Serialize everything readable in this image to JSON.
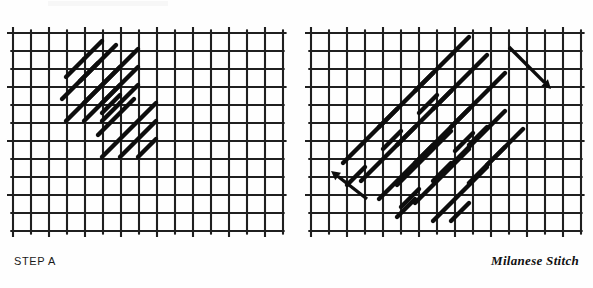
{
  "figure": {
    "title": "Milanese Stitch",
    "panels": [
      {
        "id": "a",
        "caption": "STEP A",
        "grid": {
          "x": 13,
          "y": 33,
          "cols": 15,
          "rows": 11,
          "cell": 18,
          "overhang": 6,
          "line_color": "#1f1f1f",
          "line_width": 2.1
        },
        "stitch_color": "#0d0d0d",
        "stitch_width": 4.4,
        "stitches": [
          {
            "x1": 66,
            "y1": 77,
            "x2": 84,
            "y2": 59
          },
          {
            "x1": 62,
            "y1": 99,
            "x2": 98,
            "y2": 63
          },
          {
            "x1": 66,
            "y1": 121,
            "x2": 120,
            "y2": 67
          },
          {
            "x1": 84,
            "y1": 121,
            "x2": 120,
            "y2": 85
          },
          {
            "x1": 102,
            "y1": 121,
            "x2": 120,
            "y2": 103
          },
          {
            "x1": 102,
            "y1": 113,
            "x2": 120,
            "y2": 95
          },
          {
            "x1": 98,
            "y1": 135,
            "x2": 134,
            "y2": 99
          },
          {
            "x1": 102,
            "y1": 157,
            "x2": 156,
            "y2": 103
          },
          {
            "x1": 120,
            "y1": 157,
            "x2": 156,
            "y2": 121
          },
          {
            "x1": 138,
            "y1": 157,
            "x2": 156,
            "y2": 139
          },
          {
            "x1": 84,
            "y1": 59,
            "x2": 102,
            "y2": 41
          },
          {
            "x1": 80,
            "y1": 81,
            "x2": 116,
            "y2": 45
          },
          {
            "x1": 84,
            "y1": 103,
            "x2": 138,
            "y2": 49
          },
          {
            "x1": 102,
            "y1": 103,
            "x2": 138,
            "y2": 67
          },
          {
            "x1": 120,
            "y1": 103,
            "x2": 138,
            "y2": 85
          }
        ]
      },
      {
        "id": "b",
        "caption": "STEP B",
        "grid": {
          "x": 311,
          "y": 33,
          "cols": 15,
          "rows": 11,
          "cell": 18,
          "overhang": 6,
          "line_color": "#1f1f1f",
          "line_width": 2.1
        },
        "stitch_color": "#0d0d0d",
        "stitch_width": 4.4,
        "stitches": [
          {
            "x1": 347,
            "y1": 185,
            "x2": 365,
            "y2": 167
          },
          {
            "x1": 343,
            "y1": 163,
            "x2": 397,
            "y2": 109
          },
          {
            "x1": 361,
            "y1": 181,
            "x2": 415,
            "y2": 127
          },
          {
            "x1": 379,
            "y1": 199,
            "x2": 433,
            "y2": 145
          },
          {
            "x1": 397,
            "y1": 217,
            "x2": 415,
            "y2": 199
          },
          {
            "x1": 383,
            "y1": 149,
            "x2": 401,
            "y2": 131
          },
          {
            "x1": 379,
            "y1": 127,
            "x2": 433,
            "y2": 73
          },
          {
            "x1": 397,
            "y1": 145,
            "x2": 451,
            "y2": 91
          },
          {
            "x1": 415,
            "y1": 163,
            "x2": 469,
            "y2": 109
          },
          {
            "x1": 433,
            "y1": 181,
            "x2": 451,
            "y2": 163
          },
          {
            "x1": 419,
            "y1": 113,
            "x2": 437,
            "y2": 95
          },
          {
            "x1": 415,
            "y1": 91,
            "x2": 469,
            "y2": 37
          },
          {
            "x1": 433,
            "y1": 109,
            "x2": 487,
            "y2": 55
          },
          {
            "x1": 451,
            "y1": 127,
            "x2": 505,
            "y2": 73
          },
          {
            "x1": 469,
            "y1": 145,
            "x2": 487,
            "y2": 127
          },
          {
            "x1": 401,
            "y1": 207,
            "x2": 419,
            "y2": 189
          },
          {
            "x1": 397,
            "y1": 185,
            "x2": 451,
            "y2": 131
          },
          {
            "x1": 415,
            "y1": 203,
            "x2": 469,
            "y2": 149
          },
          {
            "x1": 433,
            "y1": 221,
            "x2": 487,
            "y2": 167
          },
          {
            "x1": 451,
            "y1": 221,
            "x2": 469,
            "y2": 203
          },
          {
            "x1": 455,
            "y1": 151,
            "x2": 473,
            "y2": 133
          },
          {
            "x1": 451,
            "y1": 165,
            "x2": 505,
            "y2": 111
          },
          {
            "x1": 469,
            "y1": 183,
            "x2": 523,
            "y2": 129
          },
          {
            "x1": 487,
            "y1": 165,
            "x2": 505,
            "y2": 147
          }
        ]
      }
    ],
    "arrows": [
      {
        "name": "direction-arrow-down-right",
        "x1": 509,
        "y1": 47,
        "x2": 551,
        "y2": 89,
        "color": "#0d0d0d",
        "width": 3.4,
        "head": 9
      },
      {
        "name": "direction-arrow-up-left",
        "x1": 367,
        "y1": 199,
        "x2": 331,
        "y2": 171,
        "color": "#0d0d0d",
        "width": 3.4,
        "head": 9
      }
    ]
  }
}
